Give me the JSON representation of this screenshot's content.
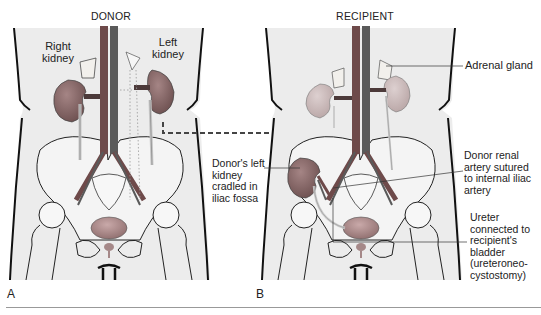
{
  "figure": {
    "panels": [
      {
        "letter": "A",
        "title": "DONOR",
        "labels": {
          "right_kidney": [
            "Right",
            "kidney"
          ],
          "left_kidney": [
            "Left",
            "kidney"
          ]
        }
      },
      {
        "letter": "B",
        "title": "RECIPIENT",
        "labels": {
          "adrenal_gland": "Adrenal gland",
          "donor_kidney": [
            "Donor's left",
            "kidney",
            "cradled in",
            "iliac fossa"
          ],
          "renal_artery": [
            "Donor renal",
            "artery sutured",
            "to internal iliac",
            "artery"
          ],
          "ureter": [
            "Ureter",
            "connected to",
            "recipient's",
            "bladder",
            "(ureteroneo-",
            "cystostomy)"
          ]
        }
      }
    ],
    "colors": {
      "body_fill": "#ececec",
      "outline": "#111111",
      "vessel_artery": "#6e4a4a",
      "vessel_vein": "#5a5a5a",
      "kidney_donor": "#8a6b6b",
      "kidney_recipient_native": "#c9b8b8",
      "adrenal": "#f2f0ec",
      "bladder": "#a58888",
      "dashed_arrow": "#444444"
    }
  }
}
